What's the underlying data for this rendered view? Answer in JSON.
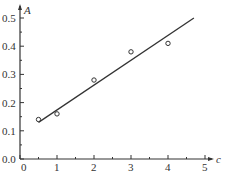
{
  "chart_data": {
    "type": "scatter",
    "title": "",
    "xlabel": "c",
    "ylabel": "A",
    "xlim": [
      0,
      5
    ],
    "ylim": [
      0.0,
      0.5
    ],
    "x_ticks": [
      "0",
      "1",
      "2",
      "3",
      "4",
      "5"
    ],
    "y_ticks": [
      "0.0",
      "0.1",
      "0.2",
      "0.3",
      "0.4",
      "0.5"
    ],
    "grid": false,
    "legend": null,
    "series": [
      {
        "name": "measured",
        "type": "scatter",
        "marker": "open-circle",
        "x": [
          0.5,
          1,
          2,
          3,
          4
        ],
        "y": [
          0.14,
          0.16,
          0.28,
          0.38,
          0.41
        ]
      },
      {
        "name": "fit",
        "type": "line",
        "x": [
          0.5,
          4.7
        ],
        "y": [
          0.13,
          0.5
        ]
      }
    ]
  },
  "colors": {
    "axis": "#333333",
    "line": "#333333",
    "marker": "#333333"
  }
}
